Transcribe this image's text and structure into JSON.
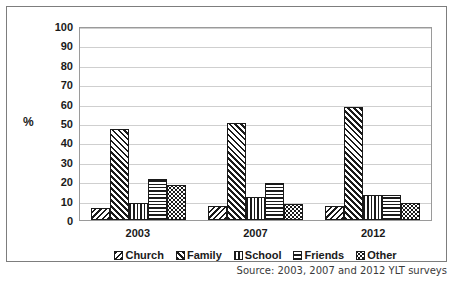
{
  "chart_data": {
    "type": "bar",
    "title": "",
    "xlabel": "",
    "ylabel": "%",
    "ylim": [
      0,
      100
    ],
    "ytick_step": 10,
    "yticks": [
      100,
      90,
      80,
      70,
      60,
      50,
      40,
      30,
      20,
      10,
      0
    ],
    "grid": true,
    "legend_position": "bottom",
    "categories": [
      "2003",
      "2007",
      "2012"
    ],
    "series": [
      {
        "name": "Church",
        "pattern": "backward-diagonal-hatch",
        "values": [
          6,
          7,
          7
        ]
      },
      {
        "name": "Family",
        "pattern": "forward-diagonal-hatch",
        "values": [
          47,
          50,
          58
        ]
      },
      {
        "name": "School",
        "pattern": "vertical-lines",
        "values": [
          9,
          12,
          13
        ]
      },
      {
        "name": "Friends",
        "pattern": "horizontal-lines",
        "values": [
          21,
          19,
          13
        ]
      },
      {
        "name": "Other",
        "pattern": "dotted-confetti",
        "values": [
          18,
          8,
          9
        ]
      }
    ],
    "source_note": "Source: 2003, 2007 and 2012 YLT surveys",
    "colors": {
      "ink": "#1a1a1a",
      "gridline": "#cfcfcf",
      "plot_border": "#9a9a9a",
      "figure_border": "#7d7d7d",
      "background": "#ffffff"
    }
  }
}
